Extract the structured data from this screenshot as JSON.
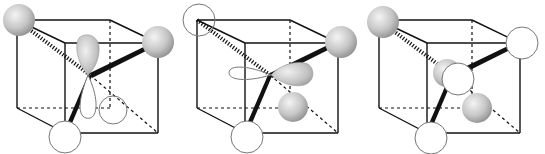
{
  "figure": {
    "panels": [
      {
        "id": "panel-1",
        "offset_x": 0,
        "corner_atoms": {
          "top_left_back": "shaded",
          "top_right_front": "shaded",
          "bottom_left_front": "open"
        },
        "orbital": "vertical p-like lobe: shaded upper lobe, open lower lobe; open sphere lower-right back"
      },
      {
        "id": "panel-2",
        "offset_x": 180,
        "corner_atoms": {
          "top_left_back": "open",
          "top_right_front": "shaded",
          "bottom_left_front": "open"
        },
        "orbital": "horizontal p-like lobe: open left lobe, shaded right lobe; shaded sphere lower-right back"
      },
      {
        "id": "panel-3",
        "offset_x": 360,
        "corner_atoms": {
          "top_left_back": "shaded",
          "top_right_front": "open",
          "bottom_left_front": "open"
        },
        "orbital": "shaded sphere behind open sphere at center; shaded sphere lower-right back"
      }
    ],
    "colors": {
      "line": "#111111",
      "open_fill": "#ffffff",
      "open_stroke": "#888888",
      "shade_light": "#f2f2f2",
      "shade_dark": "#8a8a8a"
    }
  }
}
